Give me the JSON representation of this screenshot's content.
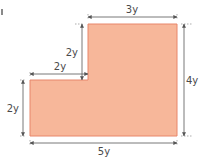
{
  "diagram": {
    "type": "composite-rectilinear-shape",
    "fill_color": "#f7b79a",
    "edge_color": "#e8866a",
    "dimension_line_color": "#555555",
    "labels": {
      "top_width": "3y",
      "step_height": "2y",
      "step_width": "2y",
      "left_height": "2y",
      "right_height": "4y",
      "bottom_width": "5y"
    }
  }
}
